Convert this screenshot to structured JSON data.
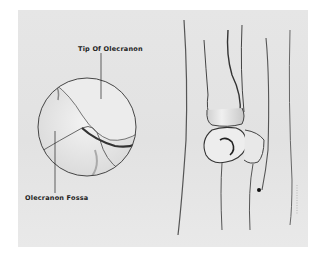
{
  "illustration": {
    "subject": "Elbow joint, posterior view with magnified inset",
    "labels": {
      "tip_of_olecranon": "Tip Of Olecranon",
      "olecranon_fossa": "Olecranon Fossa"
    },
    "colors": {
      "background": "#ffffff",
      "panel": "#e4e4e4",
      "line": "#2a2a2a",
      "bone_light": "#f2f2f2",
      "shadow": "#555555"
    }
  }
}
